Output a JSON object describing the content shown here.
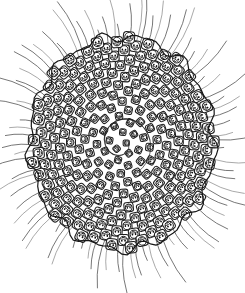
{
  "figure": {
    "title": "Composite flower head",
    "medium": "monochrome line engraving",
    "background_color": "#ffffff",
    "ink_color": "#111111",
    "bristle_color": "#4a4a4a",
    "canvas": {
      "width": 245,
      "height": 293
    },
    "head": {
      "center_x": 122,
      "center_y": 143,
      "radius_x": 92,
      "radius_y": 106,
      "unit_count": 236,
      "spiral_arms_clockwise": 21,
      "spiral_arms_counterclockwise": 13,
      "unit_name": "floret-scale"
    },
    "bristles": {
      "count": 84,
      "inner_radius_factor": 0.97,
      "outer_length_min": 18,
      "outer_length_max": 58,
      "curvature": 0.14
    }
  },
  "chart_data": {
    "type": "scatter",
    "title": "Composite flower head",
    "xlabel": "",
    "ylabel": "",
    "parastichy_counts": [
      13,
      21
    ],
    "divergence_angle_deg": 137.5,
    "unit_count": 236,
    "radial_bristle_count": 84
  }
}
